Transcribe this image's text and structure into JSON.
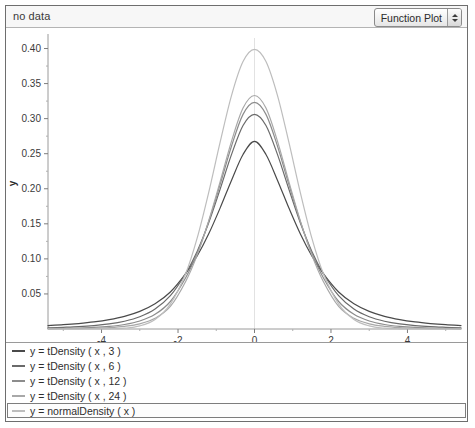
{
  "window": {
    "header": {
      "status_text": "no data",
      "plot_type_selector": {
        "value": "Function Plot",
        "stepper_up_icon": "triangle-up-icon",
        "stepper_down_icon": "triangle-down-icon"
      }
    }
  },
  "chart_data": {
    "type": "line",
    "title": "",
    "xlabel": "x",
    "ylabel": "y",
    "xlim": [
      -5.4,
      5.4
    ],
    "ylim": [
      0.0,
      0.415
    ],
    "xticks": [
      -4,
      -2,
      0,
      2,
      4
    ],
    "xtick_labels": [
      "-4",
      "-2",
      "0",
      "2",
      "4"
    ],
    "xminor_ticks": [
      -5,
      -3,
      -1,
      1,
      3,
      5
    ],
    "yticks": [
      0.05,
      0.1,
      0.15,
      0.2,
      0.25,
      0.3,
      0.35,
      0.4
    ],
    "ytick_labels": [
      "0.05",
      "0.10",
      "0.15",
      "0.20",
      "0.25",
      "0.30",
      "0.35",
      "0.40"
    ],
    "grid": false,
    "zero_line": true,
    "legend_position": "bottom",
    "series": [
      {
        "name": "y = tDensity ( x , 3 )",
        "color": "#4a4a4a",
        "peak": 0.3675,
        "x": [
          -5.4,
          -5.0,
          -4.6,
          -4.2,
          -3.8,
          -3.4,
          -3.0,
          -2.6,
          -2.2,
          -1.8,
          -1.5,
          -1.2,
          -0.9,
          -0.6,
          -0.3,
          0,
          0.3,
          0.6,
          0.9,
          1.2,
          1.5,
          1.8,
          2.2,
          2.6,
          3.0,
          3.4,
          3.8,
          4.2,
          4.6,
          5.0,
          5.4
        ],
        "y": [
          0.0049,
          0.0061,
          0.0078,
          0.0101,
          0.0134,
          0.0181,
          0.0252,
          0.036,
          0.0528,
          0.0789,
          0.104,
          0.1354,
          0.1724,
          0.2122,
          0.2489,
          0.2675,
          0.2489,
          0.2122,
          0.1724,
          0.1354,
          0.104,
          0.0789,
          0.0528,
          0.036,
          0.0252,
          0.0181,
          0.0134,
          0.0101,
          0.0078,
          0.0061,
          0.0049
        ]
      },
      {
        "name": "y = tDensity ( x , 6 )",
        "color": "#6a6a6a",
        "peak": 0.3827,
        "x": [
          -5.4,
          -5.0,
          -4.6,
          -4.2,
          -3.8,
          -3.4,
          -3.0,
          -2.6,
          -2.2,
          -1.8,
          -1.5,
          -1.2,
          -0.9,
          -0.6,
          -0.3,
          0,
          0.3,
          0.6,
          0.9,
          1.2,
          1.5,
          1.8,
          2.2,
          2.6,
          3.0,
          3.4,
          3.8,
          4.2,
          4.6,
          5.0,
          5.4
        ],
        "y": [
          0.0017,
          0.0024,
          0.0033,
          0.0048,
          0.0072,
          0.0111,
          0.0175,
          0.0285,
          0.0475,
          0.0792,
          0.1107,
          0.1512,
          0.1992,
          0.249,
          0.2903,
          0.3062,
          0.2903,
          0.249,
          0.1992,
          0.1512,
          0.1107,
          0.0792,
          0.0475,
          0.0285,
          0.0175,
          0.0111,
          0.0072,
          0.0048,
          0.0033,
          0.0024,
          0.0017
        ]
      },
      {
        "name": "y = tDensity ( x , 12 )",
        "color": "#8c8c8c",
        "peak": 0.3902,
        "x": [
          -5.4,
          -5.0,
          -4.6,
          -4.2,
          -3.8,
          -3.4,
          -3.0,
          -2.6,
          -2.2,
          -1.8,
          -1.5,
          -1.2,
          -0.9,
          -0.6,
          -0.3,
          0,
          0.3,
          0.6,
          0.9,
          1.2,
          1.5,
          1.8,
          2.2,
          2.6,
          3.0,
          3.4,
          3.8,
          4.2,
          4.6,
          5.0,
          5.4
        ],
        "y": [
          0.0006,
          0.0009,
          0.0014,
          0.0022,
          0.0037,
          0.0064,
          0.0114,
          0.0209,
          0.0392,
          0.073,
          0.1079,
          0.153,
          0.2058,
          0.261,
          0.3061,
          0.3232,
          0.3061,
          0.261,
          0.2058,
          0.153,
          0.1079,
          0.073,
          0.0392,
          0.0209,
          0.0114,
          0.0064,
          0.0037,
          0.0022,
          0.0014,
          0.0009,
          0.0006
        ]
      },
      {
        "name": "y = tDensity ( x , 24 )",
        "color": "#a8a8a8",
        "peak": 0.3944,
        "x": [
          -5.4,
          -5.0,
          -4.6,
          -4.2,
          -3.8,
          -3.4,
          -3.0,
          -2.6,
          -2.2,
          -1.8,
          -1.5,
          -1.2,
          -0.9,
          -0.6,
          -0.3,
          0,
          0.3,
          0.6,
          0.9,
          1.2,
          1.5,
          1.8,
          2.2,
          2.6,
          3.0,
          3.4,
          3.8,
          4.2,
          4.6,
          5.0,
          5.4
        ],
        "y": [
          0.0002,
          0.0004,
          0.0006,
          0.0011,
          0.002,
          0.0038,
          0.0074,
          0.0152,
          0.0321,
          0.0677,
          0.1053,
          0.1538,
          0.2098,
          0.268,
          0.3151,
          0.333,
          0.3151,
          0.268,
          0.2098,
          0.1538,
          0.1053,
          0.0677,
          0.0321,
          0.0152,
          0.0074,
          0.0038,
          0.002,
          0.0011,
          0.0006,
          0.0004,
          0.0002
        ]
      },
      {
        "name": "y = normalDensity ( x )",
        "color": "#bdbdbd",
        "peak": 0.3989,
        "x": [
          -5.4,
          -5.0,
          -4.6,
          -4.2,
          -3.8,
          -3.4,
          -3.0,
          -2.6,
          -2.2,
          -1.8,
          -1.5,
          -1.2,
          -0.9,
          -0.6,
          -0.3,
          0,
          0.3,
          0.6,
          0.9,
          1.2,
          1.5,
          1.8,
          2.2,
          2.6,
          3.0,
          3.4,
          3.8,
          4.2,
          4.6,
          5.0,
          5.4
        ],
        "y": [
          0.0,
          0.0,
          0.0,
          0.0001,
          0.0003,
          0.0012,
          0.0044,
          0.0136,
          0.0355,
          0.079,
          0.1295,
          0.1942,
          0.2661,
          0.3332,
          0.3814,
          0.3989,
          0.3814,
          0.3332,
          0.2661,
          0.1942,
          0.1295,
          0.079,
          0.0355,
          0.0136,
          0.0044,
          0.0012,
          0.0003,
          0.0001,
          0.0,
          0.0,
          0.0
        ]
      }
    ]
  },
  "legend": {
    "selected_index": 4,
    "items": [
      {
        "label": "y = tDensity ( x , 3 )",
        "color": "#4a4a4a"
      },
      {
        "label": "y = tDensity ( x , 6 )",
        "color": "#6a6a6a"
      },
      {
        "label": "y = tDensity ( x , 12 )",
        "color": "#8c8c8c"
      },
      {
        "label": "y = tDensity ( x , 24 )",
        "color": "#a8a8a8"
      },
      {
        "label": "y = normalDensity ( x )",
        "color": "#bdbdbd"
      }
    ]
  }
}
